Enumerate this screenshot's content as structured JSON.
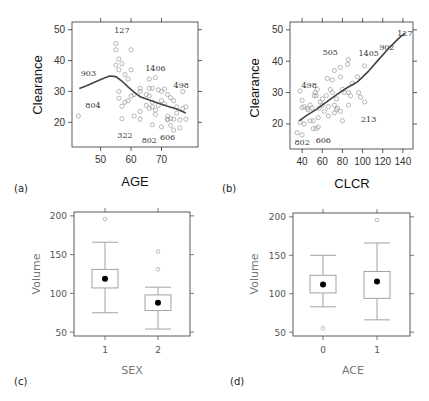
{
  "chart_data": [
    {
      "id": "a",
      "type": "scatter",
      "panel_label": "(a)",
      "xlabel": "AGE",
      "ylabel": "Clearance",
      "xlim": [
        40.6,
        82
      ],
      "ylim": [
        12,
        52.5
      ],
      "xticks": [
        50,
        60,
        70
      ],
      "yticks": [
        20,
        30,
        40,
        50
      ],
      "grid": false,
      "points": [
        [
          42.7,
          22
        ],
        [
          55,
          45.5
        ],
        [
          55,
          43.5
        ],
        [
          60,
          43.5
        ],
        [
          56,
          40.5
        ],
        [
          57,
          39
        ],
        [
          55,
          38.5
        ],
        [
          56,
          37
        ],
        [
          58,
          35.5
        ],
        [
          60,
          37
        ],
        [
          59,
          34
        ],
        [
          66,
          34
        ],
        [
          68,
          34.5
        ],
        [
          56,
          30
        ],
        [
          56,
          27.8
        ],
        [
          57,
          25.2
        ],
        [
          58,
          26.5
        ],
        [
          59,
          27
        ],
        [
          60,
          28.5
        ],
        [
          61,
          29
        ],
        [
          63,
          31
        ],
        [
          63,
          30
        ],
        [
          65,
          29
        ],
        [
          66,
          28.5
        ],
        [
          66,
          31
        ],
        [
          67,
          31
        ],
        [
          69,
          30.5
        ],
        [
          70,
          30
        ],
        [
          71,
          30.8
        ],
        [
          72,
          29
        ],
        [
          73,
          28
        ],
        [
          74,
          27
        ],
        [
          77,
          30
        ],
        [
          57,
          21.2
        ],
        [
          61,
          22
        ],
        [
          63,
          21
        ],
        [
          63,
          23.5
        ],
        [
          65,
          25.5
        ],
        [
          66,
          24.5
        ],
        [
          67,
          25
        ],
        [
          67,
          26.5
        ],
        [
          68,
          22.5
        ],
        [
          68,
          24
        ],
        [
          69,
          25.5
        ],
        [
          70,
          27
        ],
        [
          71,
          26
        ],
        [
          72,
          22
        ],
        [
          72,
          20.8
        ],
        [
          73,
          21.2
        ],
        [
          74,
          21
        ],
        [
          75,
          23
        ],
        [
          75,
          25
        ],
        [
          77,
          24.5
        ],
        [
          78,
          25
        ],
        [
          78,
          21
        ],
        [
          76,
          20.8
        ],
        [
          67,
          19.2
        ],
        [
          70,
          18.5
        ],
        [
          73,
          19
        ],
        [
          74,
          17.5
        ],
        [
          76,
          18.2
        ],
        [
          72,
          21
        ]
      ],
      "point_labels": [
        {
          "text": "127",
          "x": 57,
          "y": 50
        },
        {
          "text": "1406",
          "x": 68,
          "y": 37.5
        },
        {
          "text": "903",
          "x": 46,
          "y": 36
        },
        {
          "text": "498",
          "x": 76.5,
          "y": 32
        },
        {
          "text": "804",
          "x": 47.5,
          "y": 25.5
        },
        {
          "text": "322",
          "x": 58,
          "y": 16
        },
        {
          "text": "802",
          "x": 66,
          "y": 14.2
        },
        {
          "text": "606",
          "x": 72,
          "y": 15.2
        }
      ],
      "smooth": [
        [
          43,
          31
        ],
        [
          45,
          31.7
        ],
        [
          48,
          33
        ],
        [
          51,
          34.3
        ],
        [
          53,
          35
        ],
        [
          55,
          34.8
        ],
        [
          57,
          33.4
        ],
        [
          59,
          31.5
        ],
        [
          61,
          29.8
        ],
        [
          63,
          28.3
        ],
        [
          66,
          27.2
        ],
        [
          69,
          26.2
        ],
        [
          72,
          25.2
        ],
        [
          75,
          24.3
        ],
        [
          78,
          23
        ]
      ]
    },
    {
      "id": "b",
      "type": "scatter",
      "panel_label": "(b)",
      "xlabel": "CLCR",
      "ylabel": "Clearance",
      "xlim": [
        28,
        150
      ],
      "ylim": [
        12,
        52.5
      ],
      "xticks": [
        40,
        60,
        80,
        100,
        120,
        140
      ],
      "yticks": [
        20,
        30,
        40,
        50
      ],
      "grid": false,
      "points": [
        [
          35,
          17.2
        ],
        [
          40,
          16.5
        ],
        [
          38,
          20.5
        ],
        [
          42,
          20
        ],
        [
          48,
          21
        ],
        [
          51,
          21
        ],
        [
          54,
          18.5
        ],
        [
          56,
          19
        ],
        [
          51,
          18.5
        ],
        [
          56,
          22
        ],
        [
          38,
          30.5
        ],
        [
          40,
          27.5
        ],
        [
          40,
          25.2
        ],
        [
          42,
          25.5
        ],
        [
          45,
          25
        ],
        [
          46,
          24.5
        ],
        [
          48,
          26
        ],
        [
          50,
          25
        ],
        [
          52,
          29
        ],
        [
          54,
          29
        ],
        [
          55,
          31
        ],
        [
          57,
          25
        ],
        [
          58,
          27
        ],
        [
          60,
          26
        ],
        [
          60,
          28
        ],
        [
          62,
          24
        ],
        [
          64,
          29
        ],
        [
          66,
          22.5
        ],
        [
          66,
          25.5
        ],
        [
          68,
          31
        ],
        [
          70,
          30
        ],
        [
          70,
          34
        ],
        [
          72,
          37
        ],
        [
          72,
          26
        ],
        [
          74,
          24.5
        ],
        [
          74,
          28
        ],
        [
          75,
          25
        ],
        [
          65,
          34.5
        ],
        [
          78,
          35
        ],
        [
          78,
          38
        ],
        [
          80,
          31
        ],
        [
          80,
          21
        ],
        [
          82,
          30
        ],
        [
          85,
          39
        ],
        [
          86,
          40.5
        ],
        [
          86,
          30
        ],
        [
          86,
          26
        ],
        [
          88,
          29
        ],
        [
          90,
          33
        ],
        [
          95,
          35
        ],
        [
          96,
          30
        ],
        [
          98,
          28.5
        ],
        [
          102,
          38.5
        ],
        [
          102,
          27
        ],
        [
          78,
          24
        ],
        [
          72,
          23.5
        ],
        [
          53,
          30
        ]
      ],
      "point_labels": [
        {
          "text": "127",
          "x": 142,
          "y": 49
        },
        {
          "text": "902",
          "x": 124,
          "y": 44.5
        },
        {
          "text": "1405",
          "x": 106,
          "y": 42.5
        },
        {
          "text": "505",
          "x": 68,
          "y": 43
        },
        {
          "text": "498",
          "x": 47,
          "y": 32.5
        },
        {
          "text": "213",
          "x": 106,
          "y": 21.5
        },
        {
          "text": "802",
          "x": 40,
          "y": 14.3
        },
        {
          "text": "606",
          "x": 61,
          "y": 15
        }
      ],
      "smooth": [
        [
          37,
          21
        ],
        [
          45,
          22.8
        ],
        [
          55,
          24.8
        ],
        [
          65,
          27.2
        ],
        [
          75,
          29.5
        ],
        [
          85,
          31.6
        ],
        [
          95,
          33.4
        ],
        [
          105,
          36.5
        ],
        [
          115,
          40.2
        ],
        [
          125,
          43.8
        ],
        [
          135,
          47
        ],
        [
          142,
          49
        ]
      ]
    },
    {
      "id": "c",
      "type": "box",
      "panel_label": "(c)",
      "xlabel": "SEX",
      "ylabel": "Volume",
      "categories": [
        "1",
        "2"
      ],
      "ylim": [
        45,
        205
      ],
      "yticks": [
        50,
        100,
        150,
        200
      ],
      "grid": false,
      "boxes": [
        {
          "category": "1",
          "whisker_low": 75,
          "q1": 107,
          "median": 119,
          "q3": 131,
          "whisker_high": 166,
          "outliers": [
            196
          ]
        },
        {
          "category": "2",
          "whisker_low": 54,
          "q1": 78,
          "median": 88,
          "q3": 98,
          "whisker_high": 108,
          "outliers": [
            154,
            131
          ]
        }
      ]
    },
    {
      "id": "d",
      "type": "box",
      "panel_label": "(d)",
      "xlabel": "ACE",
      "ylabel": "Volume",
      "categories": [
        "0",
        "1"
      ],
      "ylim": [
        45,
        205
      ],
      "yticks": [
        50,
        100,
        150,
        200
      ],
      "grid": false,
      "boxes": [
        {
          "category": "0",
          "whisker_low": 83,
          "q1": 101,
          "median": 112,
          "q3": 124,
          "whisker_high": 150,
          "outliers": [
            55
          ]
        },
        {
          "category": "1",
          "whisker_low": 66,
          "q1": 94,
          "median": 116,
          "q3": 129,
          "whisker_high": 166,
          "outliers": [
            196
          ]
        }
      ]
    }
  ]
}
